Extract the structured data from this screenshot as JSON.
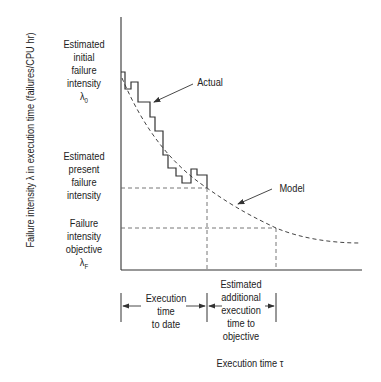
{
  "diagram": {
    "y_axis_label": "Failure intensity λ in execution time (failures/CPU hr)",
    "x_axis_label": "Execution time τ",
    "left_labels": {
      "initial": [
        "Estimated",
        "initial",
        "failure",
        "intensity"
      ],
      "initial_symbol": "λ",
      "initial_subscript": "0",
      "present": [
        "Estimated",
        "present",
        "failure",
        "intensity"
      ],
      "objective": [
        "Failure",
        "intensity",
        "objective"
      ],
      "objective_symbol": "λ",
      "objective_subscript": "F"
    },
    "curve_labels": {
      "actual": "Actual",
      "model": "Model"
    },
    "bottom_labels": {
      "to_date": [
        "Execution",
        "time",
        "to date"
      ],
      "additional": [
        "Estimated",
        "additional",
        "execution",
        "time to",
        "objective"
      ]
    },
    "colors": {
      "line": "#333333",
      "dashed": "#555555",
      "text": "#222222"
    }
  }
}
